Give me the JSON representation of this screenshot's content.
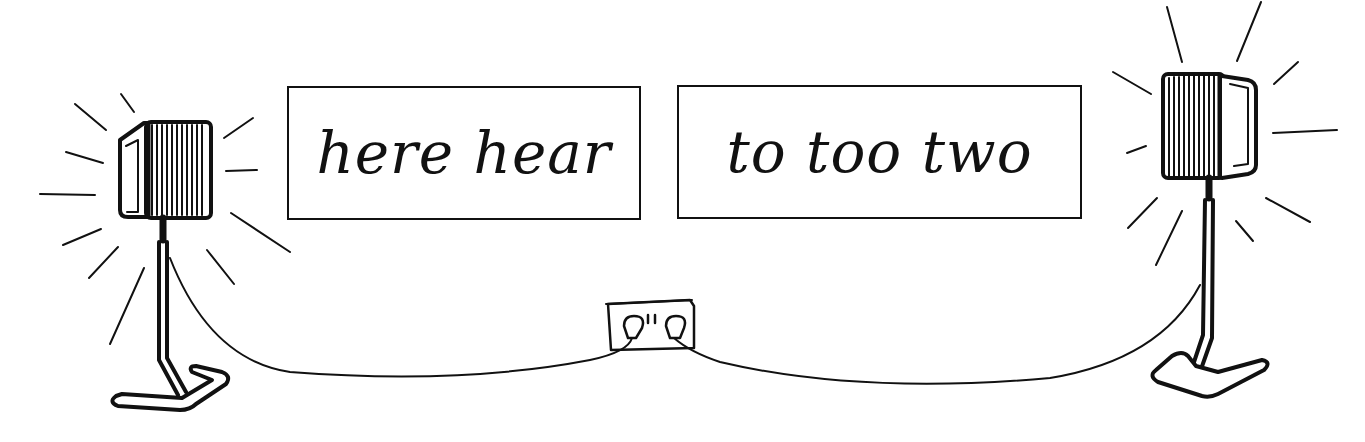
{
  "illustration": {
    "subject": "homophones",
    "cards": [
      {
        "text": "here hear"
      },
      {
        "text": "to too two"
      }
    ],
    "objects": [
      "left-speaker",
      "right-speaker",
      "power-socket",
      "cables"
    ],
    "colors": {
      "ink": "#111111",
      "background": "#ffffff"
    }
  }
}
